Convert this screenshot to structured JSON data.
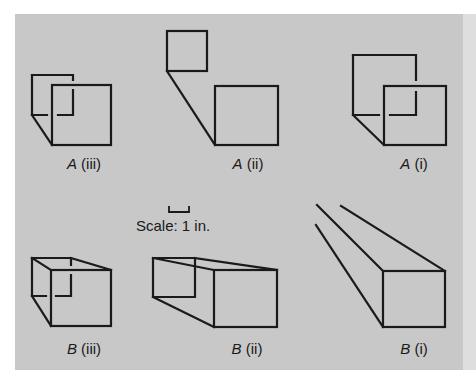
{
  "figure": {
    "background_color": "#c8c8c8",
    "line_color": "#1a1a1a",
    "scale": {
      "label": "Scale: 1 in."
    },
    "panels": [
      {
        "id": "A-iii",
        "letter": "A",
        "numeral": "(iii)"
      },
      {
        "id": "A-ii",
        "letter": "A",
        "numeral": "(ii)"
      },
      {
        "id": "A-i",
        "letter": "A",
        "numeral": "(i)"
      },
      {
        "id": "B-iii",
        "letter": "B",
        "numeral": "(iii)"
      },
      {
        "id": "B-ii",
        "letter": "B",
        "numeral": "(ii)"
      },
      {
        "id": "B-i",
        "letter": "B",
        "numeral": "(i)"
      }
    ]
  }
}
